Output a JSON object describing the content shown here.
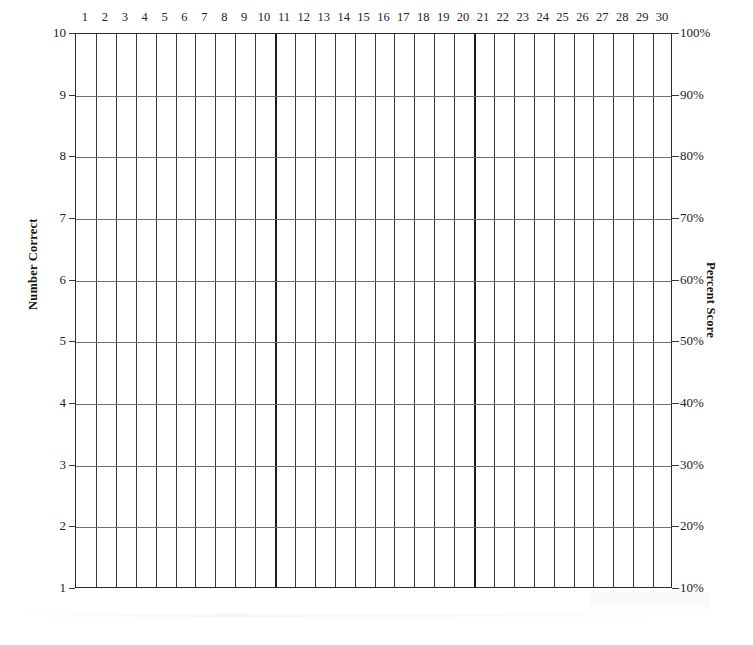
{
  "chart_data": {
    "type": "table",
    "title": "",
    "subtitle": "",
    "xlabel": "",
    "ylabel": "Number Correct",
    "y2label": "Percent Score",
    "grid": true,
    "legend": null,
    "series": [],
    "values": [],
    "x_axis": {
      "position": "top",
      "categories": [
        1,
        2,
        3,
        4,
        5,
        6,
        7,
        8,
        9,
        10,
        11,
        12,
        13,
        14,
        15,
        16,
        17,
        18,
        19,
        20,
        21,
        22,
        23,
        24,
        25,
        26,
        27,
        28,
        29,
        30
      ],
      "tick_labels": [
        "1",
        "2",
        "3",
        "4",
        "5",
        "6",
        "7",
        "8",
        "9",
        "10",
        "11",
        "12",
        "13",
        "14",
        "15",
        "16",
        "17",
        "18",
        "19",
        "20",
        "21",
        "22",
        "23",
        "24",
        "25",
        "26",
        "27",
        "28",
        "29",
        "30"
      ],
      "column_count": 30,
      "major_gridline_after_columns": [
        10,
        20
      ]
    },
    "y_axis_left": {
      "position": "left",
      "label": "Number Correct",
      "ylim": [
        1,
        10
      ],
      "tick_values": [
        10,
        9,
        8,
        7,
        6,
        5,
        4,
        3,
        2,
        1
      ],
      "tick_labels": [
        "10",
        "9",
        "8",
        "7",
        "6",
        "5",
        "4",
        "3",
        "2",
        "1"
      ]
    },
    "y_axis_right": {
      "position": "right",
      "label": "Percent Score",
      "ylim": [
        10,
        100
      ],
      "tick_values": [
        100,
        90,
        80,
        70,
        60,
        50,
        40,
        30,
        20,
        10
      ],
      "tick_labels": [
        "100%",
        "90%",
        "80%",
        "70%",
        "60%",
        "50%",
        "40%",
        "30%",
        "20%",
        "10%"
      ]
    },
    "colors": {
      "background": "#ffffff",
      "vertical_gridline": "#3a3a3a",
      "vertical_gridline_major": "#1c1c1c",
      "horizontal_gridline": "#6f6f6f",
      "border": "#2b2b2b",
      "text": "#232323",
      "axis_title": "#141414"
    }
  }
}
